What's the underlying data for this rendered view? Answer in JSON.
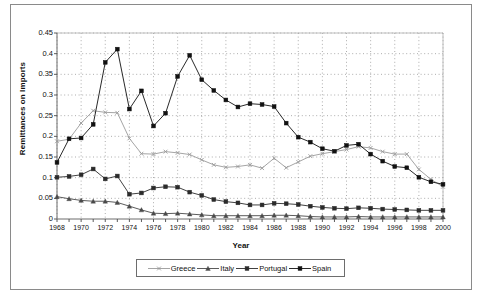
{
  "figure": {
    "panel_label": "a.",
    "y_axis_title": "Remittances on Imports",
    "x_axis_title": "Year"
  },
  "legend": {
    "position": "bottom",
    "entries": [
      {
        "label": "Greece",
        "color": "#9a9a9a",
        "marker": "x"
      },
      {
        "label": "Italy",
        "color": "#4a4a4a",
        "marker": "triangle"
      },
      {
        "label": "Portugal",
        "color": "#2b2b2b",
        "marker": "square"
      },
      {
        "label": "Spain",
        "color": "#111111",
        "marker": "square"
      }
    ]
  },
  "chart_data": {
    "type": "line",
    "title": "",
    "xlabel": "Year",
    "ylabel": "Remittances on Imports",
    "xlim": [
      1968,
      2000
    ],
    "ylim": [
      0,
      0.45
    ],
    "grid": true,
    "legend_position": "bottom",
    "x_tick_labels": [
      "1968",
      "1970",
      "1972",
      "1974",
      "1976",
      "1978",
      "1980",
      "1982",
      "1984",
      "1986",
      "1988",
      "1990",
      "1992",
      "1994",
      "1996",
      "1998",
      "2000"
    ],
    "y_tick_labels": [
      "0",
      "0.05",
      "0.1",
      "0.15",
      "0.2",
      "0.25",
      "0.3",
      "0.35",
      "0.4",
      "0.45"
    ],
    "x": [
      1968,
      1969,
      1970,
      1971,
      1972,
      1973,
      1974,
      1975,
      1976,
      1977,
      1978,
      1979,
      1980,
      1981,
      1982,
      1983,
      1984,
      1985,
      1986,
      1987,
      1988,
      1989,
      1990,
      1991,
      1992,
      1993,
      1994,
      1995,
      1996,
      1997,
      1998,
      1999,
      2000
    ],
    "series": [
      {
        "name": "Greece",
        "color": "#9a9a9a",
        "marker": "x",
        "values": [
          0.188,
          0.193,
          0.232,
          0.262,
          0.258,
          0.257,
          0.195,
          0.158,
          0.157,
          0.163,
          0.16,
          0.156,
          0.143,
          0.131,
          0.125,
          0.127,
          0.131,
          0.123,
          0.147,
          0.124,
          0.138,
          0.152,
          0.158,
          0.163,
          0.168,
          0.175,
          0.172,
          0.163,
          0.157,
          0.157,
          0.12,
          0.096,
          0.078
        ]
      },
      {
        "name": "Italy",
        "color": "#4a4a4a",
        "marker": "triangle",
        "values": [
          0.054,
          0.049,
          0.045,
          0.043,
          0.043,
          0.04,
          0.031,
          0.022,
          0.014,
          0.013,
          0.014,
          0.012,
          0.01,
          0.008,
          0.008,
          0.008,
          0.008,
          0.008,
          0.009,
          0.009,
          0.008,
          0.006,
          0.005,
          0.005,
          0.005,
          0.006,
          0.005,
          0.005,
          0.005,
          0.005,
          0.005,
          0.005,
          0.005
        ]
      },
      {
        "name": "Portugal",
        "color": "#2b2b2b",
        "marker": "square",
        "values": [
          0.101,
          0.103,
          0.107,
          0.121,
          0.097,
          0.104,
          0.06,
          0.063,
          0.075,
          0.078,
          0.077,
          0.065,
          0.057,
          0.047,
          0.042,
          0.039,
          0.034,
          0.034,
          0.038,
          0.037,
          0.035,
          0.031,
          0.028,
          0.026,
          0.025,
          0.027,
          0.026,
          0.024,
          0.023,
          0.022,
          0.021,
          0.021,
          0.021
        ]
      },
      {
        "name": "Spain",
        "color": "#111111",
        "marker": "square",
        "values": [
          0.137,
          0.194,
          0.196,
          0.229,
          0.379,
          0.411,
          0.266,
          0.31,
          0.225,
          0.256,
          0.345,
          0.396,
          0.337,
          0.311,
          0.288,
          0.271,
          0.279,
          0.277,
          0.272,
          0.232,
          0.198,
          0.186,
          0.17,
          0.164,
          0.178,
          0.181,
          0.157,
          0.14,
          0.127,
          0.124,
          0.101,
          0.09,
          0.084
        ]
      }
    ]
  }
}
